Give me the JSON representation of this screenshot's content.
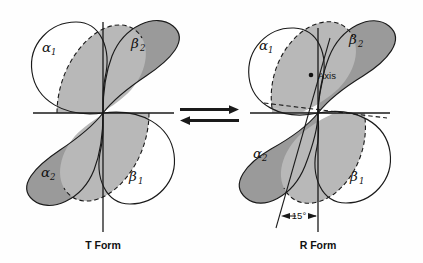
{
  "figure": {
    "type": "diagram",
    "background_color": "#fefefe",
    "ink_color": "#1a1a1a"
  },
  "palette": {
    "white_lobe": "#ffffff",
    "dark_lobe": "#9a9a9a",
    "mid_overlap": "#b8b8b8",
    "outline": "#1a1a1a"
  },
  "structures": [
    {
      "id": "t-form",
      "caption": "T Form",
      "subunits": [
        {
          "key": "alpha1",
          "label": "α",
          "subscript": "1",
          "fill": "white",
          "position": "upper-left"
        },
        {
          "key": "beta2",
          "label": "β",
          "subscript": "2",
          "fill": "dark",
          "position": "upper-right"
        },
        {
          "key": "alpha2",
          "label": "α",
          "subscript": "2",
          "fill": "dark",
          "position": "lower-left"
        },
        {
          "key": "beta1",
          "label": "β",
          "subscript": "1",
          "fill": "white",
          "position": "lower-right"
        }
      ],
      "annotations": []
    },
    {
      "id": "r-form",
      "caption": "R Form",
      "subunits": [
        {
          "key": "alpha1",
          "label": "α",
          "subscript": "1",
          "fill": "white",
          "position": "upper-left"
        },
        {
          "key": "beta2",
          "label": "β",
          "subscript": "2",
          "fill": "dark",
          "position": "upper-right"
        },
        {
          "key": "alpha2",
          "label": "α",
          "subscript": "2",
          "fill": "dark",
          "position": "lower-left"
        },
        {
          "key": "beta1",
          "label": "β",
          "subscript": "1",
          "fill": "white",
          "position": "lower-right"
        }
      ],
      "annotations": [
        {
          "key": "axis",
          "text": "Axis",
          "marker": "dot"
        },
        {
          "key": "angle",
          "text": "15°",
          "marker": "double-arrow"
        }
      ]
    }
  ],
  "equilibrium": {
    "symbol": "reversible-double-arrow",
    "top_direction": "right",
    "bottom_direction": "left"
  }
}
